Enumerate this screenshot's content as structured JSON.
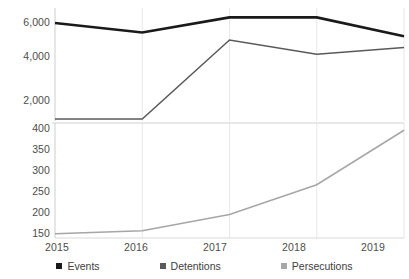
{
  "chart_data": {
    "type": "line",
    "title": "",
    "xlabel": "",
    "ylabel": "",
    "broken_axis": true,
    "grid": true,
    "legend_position": "bottom",
    "categories": [
      "2015",
      "2016",
      "2017",
      "2018",
      "2019"
    ],
    "panels": [
      {
        "name": "upper",
        "ylim": [
          1000,
          7000
        ],
        "yticks": [
          2000,
          4000,
          6000
        ],
        "ytick_labels": [
          "2,000",
          "4,000",
          "6,000"
        ],
        "series": [
          {
            "name": "Events",
            "color": "#1a1a1a",
            "width": 2.6,
            "values": [
              6200,
              5700,
              6500,
              6500,
              5500
            ]
          },
          {
            "name": "Detentions",
            "color": "#595959",
            "width": 1.5,
            "values": [
              1100,
              1100,
              5300,
              4550,
              4900
            ]
          }
        ]
      },
      {
        "name": "lower",
        "ylim": [
          140,
          410
        ],
        "yticks": [
          150,
          200,
          250,
          300,
          350,
          400
        ],
        "ytick_labels": [
          "150",
          "200",
          "250",
          "300",
          "350",
          "400"
        ],
        "series": [
          {
            "name": "Persecutions",
            "color": "#a6a6a6",
            "width": 1.5,
            "values": [
              150,
              157,
              195,
              265,
              393
            ]
          }
        ]
      }
    ],
    "legend": [
      {
        "label": "Events",
        "color": "#1a1a1a"
      },
      {
        "label": "Detentions",
        "color": "#595959"
      },
      {
        "label": "Persecutions",
        "color": "#a6a6a6"
      }
    ]
  },
  "axis": {
    "upper_ticks": [
      "6,000",
      "4,000",
      "2,000"
    ],
    "lower_ticks": [
      "400",
      "350",
      "300",
      "250",
      "200",
      "150"
    ],
    "x_ticks": [
      "2015",
      "2016",
      "2017",
      "2018",
      "2019"
    ]
  }
}
